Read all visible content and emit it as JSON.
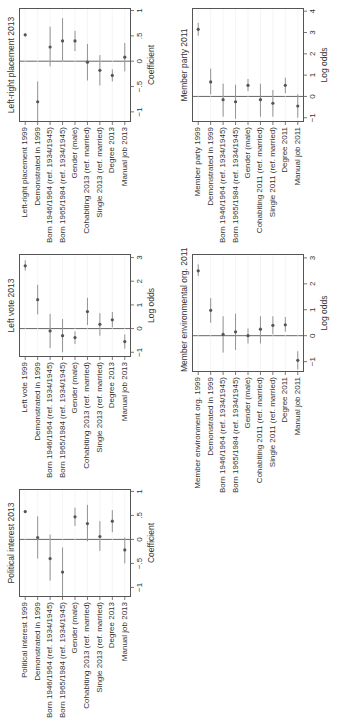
{
  "chart_data": [
    {
      "id": "pi",
      "type": "scatter",
      "title": "Political interest 2013",
      "xlabel": "Coefficient",
      "xlim": [
        -1.2,
        1.05
      ],
      "ticks": [
        -1,
        -0.5,
        0,
        0.5,
        1
      ],
      "tick_labels": [
        "−1",
        "−.5",
        "0",
        ".5",
        "1"
      ],
      "categories": [
        "Political interest 1999",
        "Demonstrated in 1999",
        "Born 1946/1964 (ref. 1934/1945)",
        "Born 1965/1984 (ref. 1934/1945)",
        "Gender (male)",
        "Cohabiting 2013 (ref. married)",
        "Single 2013 (ref. married)",
        "Degree 2013",
        "Manual job 2013"
      ],
      "values": [
        0.58,
        0.04,
        -0.4,
        -0.68,
        0.47,
        0.33,
        0.06,
        0.38,
        -0.22
      ],
      "lo": [
        0.55,
        -0.4,
        -0.86,
        -1.2,
        0.28,
        -0.04,
        -0.24,
        0.15,
        -0.5
      ],
      "hi": [
        0.61,
        0.48,
        0.1,
        -0.17,
        0.66,
        0.72,
        0.38,
        0.61,
        0.04
      ]
    },
    {
      "id": "lv",
      "type": "scatter",
      "title": "Left vote 2013",
      "xlabel": "Log odds",
      "xlim": [
        -1.2,
        3.15
      ],
      "ticks": [
        -1,
        0,
        1,
        2,
        3
      ],
      "tick_labels": [
        "−1",
        "0",
        "1",
        "2",
        "3"
      ],
      "categories": [
        "Left vote 1999",
        "Demonstrated in 1999",
        "Born 1946/1964 (ref. 1934/1945)",
        "Born 1965/1984 (ref. 1934/1945)",
        "Gender (male)",
        "Cohabiting 2013 (ref. married)",
        "Single 2013 (ref. married)",
        "Degree 2013",
        "Manual job 2013"
      ],
      "values": [
        2.65,
        1.22,
        -0.1,
        -0.3,
        -0.38,
        0.72,
        0.18,
        0.37,
        -0.55
      ],
      "lo": [
        2.45,
        0.6,
        -0.82,
        -1.0,
        -0.65,
        0.15,
        -0.3,
        0.05,
        -0.85
      ],
      "hi": [
        2.88,
        1.85,
        0.62,
        0.4,
        -0.12,
        1.3,
        0.65,
        0.7,
        -0.25
      ]
    },
    {
      "id": "lr",
      "type": "scatter",
      "title": "Left-right placement 2013",
      "xlabel": "Coefficient",
      "xlim": [
        -1.2,
        1.05
      ],
      "ticks": [
        -1,
        -0.5,
        0,
        0.5,
        1
      ],
      "tick_labels": [
        "−1",
        "−.5",
        "0",
        ".5",
        "1"
      ],
      "categories": [
        "Left-right placement 1999",
        "Demonstrated in 1999",
        "Born 1946/1964 (ref. 1934/1945)",
        "Born 1965/1984 (ref. 1934/1945)",
        "Gender (male)",
        "Cohabiting 2013 (ref. married)",
        "Single 2013 (ref. married)",
        "Degree 2013",
        "Manual job 2013"
      ],
      "values": [
        0.52,
        -0.8,
        0.28,
        0.4,
        0.4,
        -0.02,
        -0.18,
        -0.28,
        0.08
      ],
      "lo": [
        0.49,
        -1.2,
        -0.1,
        0.0,
        0.2,
        -0.38,
        -0.48,
        -0.4,
        -0.2
      ],
      "hi": [
        0.55,
        -0.4,
        0.68,
        0.85,
        0.6,
        0.34,
        0.12,
        -0.16,
        0.36
      ]
    },
    {
      "id": "env",
      "type": "scatter",
      "title": "Member environmental org. 2011",
      "xlabel": "Log odds",
      "xlim": [
        -1.4,
        3.15
      ],
      "ticks": [
        -1,
        0,
        1,
        2,
        3
      ],
      "tick_labels": [
        "−1",
        "0",
        "1",
        "2",
        "3"
      ],
      "categories": [
        "Member environment org. 1999",
        "Demonstrated in 1999",
        "Born 1946/1964 (ref. 1934/1945)",
        "Born 1965/1984 (ref. 1934/1945)",
        "Gender (male)",
        "Cohabiting 2011 (ref. married)",
        "Single 2011 (ref. married)",
        "Degree 2011",
        "Manual job 2011"
      ],
      "values": [
        2.5,
        0.98,
        0.05,
        0.15,
        0.0,
        0.25,
        0.4,
        0.42,
        -0.95
      ],
      "lo": [
        2.3,
        0.5,
        -0.65,
        -0.55,
        -0.3,
        -0.3,
        0.05,
        0.15,
        -1.3
      ],
      "hi": [
        2.75,
        1.45,
        0.75,
        0.85,
        0.28,
        0.75,
        0.75,
        0.72,
        -0.6
      ]
    },
    {
      "id": "mp",
      "type": "scatter",
      "title": "Member party 2011",
      "xlabel": "Log odds",
      "xlim": [
        -1.2,
        4.15
      ],
      "ticks": [
        -1,
        0,
        1,
        2,
        3,
        4
      ],
      "tick_labels": [
        "−1",
        "0",
        "1",
        "2",
        "3",
        "4"
      ],
      "categories": [
        "Member party 1999",
        "Demonstrated in 1999",
        "Born 1946/1964 (ref. 1934/1945)",
        "Born 1965/1984 (ref. 1934/1945)",
        "Gender (male)",
        "Cohabiting 2011 (ref. married)",
        "Single 2011 (ref. married)",
        "Degree 2011",
        "Manual job 2011"
      ],
      "values": [
        3.15,
        0.68,
        -0.15,
        -0.25,
        0.52,
        -0.15,
        -0.32,
        0.52,
        -0.45
      ],
      "lo": [
        2.85,
        0.1,
        -0.95,
        -1.05,
        0.25,
        -0.95,
        -0.95,
        0.15,
        -1.0
      ],
      "hi": [
        3.45,
        1.3,
        0.6,
        0.55,
        0.82,
        0.6,
        0.3,
        0.88,
        0.1
      ]
    }
  ]
}
